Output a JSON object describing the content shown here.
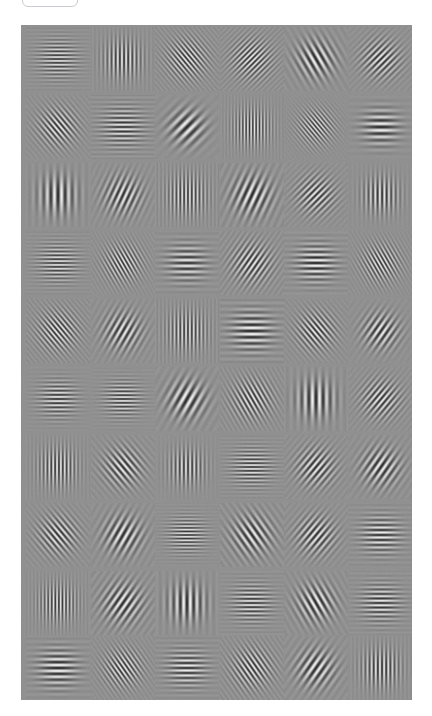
{
  "top_control": {
    "label": "",
    "name": "rounded-button-clipped"
  },
  "stimulus": {
    "background_color": "#8e8e8e",
    "canvas": {
      "x": 21,
      "y": 25,
      "width": 391,
      "height": 675
    },
    "grid": {
      "rows": 10,
      "columns": 6,
      "cell_pitch_x": 65,
      "cell_pitch_y": 68
    },
    "patch_type": "gabor",
    "column_centers": [
      37,
      102,
      166,
      231,
      295,
      360
    ],
    "row_centers": [
      34,
      102,
      170,
      238,
      306,
      374,
      442,
      510,
      578,
      643
    ],
    "patches": [
      {
        "row": 0,
        "col": 0,
        "orientation": 0,
        "frequency": 0.26,
        "phase": 0,
        "sigma": 13,
        "contrast": 0.78
      },
      {
        "row": 0,
        "col": 1,
        "orientation": 90,
        "frequency": 0.24,
        "phase": 90,
        "sigma": 13,
        "contrast": 0.82
      },
      {
        "row": 0,
        "col": 2,
        "orientation": 50,
        "frequency": 0.27,
        "phase": 0,
        "sigma": 14,
        "contrast": 0.8
      },
      {
        "row": 0,
        "col": 3,
        "orientation": 135,
        "frequency": 0.26,
        "phase": 0,
        "sigma": 14,
        "contrast": 0.8
      },
      {
        "row": 0,
        "col": 4,
        "orientation": 60,
        "frequency": 0.16,
        "phase": 0,
        "sigma": 13,
        "contrast": 0.9
      },
      {
        "row": 0,
        "col": 5,
        "orientation": 135,
        "frequency": 0.22,
        "phase": 0,
        "sigma": 13,
        "contrast": 0.82
      },
      {
        "row": 1,
        "col": 0,
        "orientation": 50,
        "frequency": 0.24,
        "phase": 0,
        "sigma": 13,
        "contrast": 0.82
      },
      {
        "row": 1,
        "col": 1,
        "orientation": 0,
        "frequency": 0.22,
        "phase": 0,
        "sigma": 14,
        "contrast": 0.8
      },
      {
        "row": 1,
        "col": 2,
        "orientation": 135,
        "frequency": 0.13,
        "phase": 0,
        "sigma": 12,
        "contrast": 0.88
      },
      {
        "row": 1,
        "col": 3,
        "orientation": 90,
        "frequency": 0.3,
        "phase": 90,
        "sigma": 13,
        "contrast": 0.8
      },
      {
        "row": 1,
        "col": 4,
        "orientation": 50,
        "frequency": 0.3,
        "phase": 0,
        "sigma": 12,
        "contrast": 0.72
      },
      {
        "row": 1,
        "col": 5,
        "orientation": 0,
        "frequency": 0.15,
        "phase": 0,
        "sigma": 12,
        "contrast": 0.88
      },
      {
        "row": 2,
        "col": 0,
        "orientation": 90,
        "frequency": 0.14,
        "phase": 0,
        "sigma": 13,
        "contrast": 0.88
      },
      {
        "row": 2,
        "col": 1,
        "orientation": 115,
        "frequency": 0.18,
        "phase": 0,
        "sigma": 13,
        "contrast": 0.84
      },
      {
        "row": 2,
        "col": 2,
        "orientation": 90,
        "frequency": 0.26,
        "phase": 90,
        "sigma": 14,
        "contrast": 0.8
      },
      {
        "row": 2,
        "col": 3,
        "orientation": 115,
        "frequency": 0.15,
        "phase": 0,
        "sigma": 14,
        "contrast": 0.9
      },
      {
        "row": 2,
        "col": 4,
        "orientation": 135,
        "frequency": 0.22,
        "phase": 0,
        "sigma": 13,
        "contrast": 0.8
      },
      {
        "row": 2,
        "col": 5,
        "orientation": 90,
        "frequency": 0.22,
        "phase": 90,
        "sigma": 12,
        "contrast": 0.82
      },
      {
        "row": 3,
        "col": 0,
        "orientation": 0,
        "frequency": 0.26,
        "phase": 0,
        "sigma": 13,
        "contrast": 0.78
      },
      {
        "row": 3,
        "col": 1,
        "orientation": 60,
        "frequency": 0.28,
        "phase": 0,
        "sigma": 13,
        "contrast": 0.78
      },
      {
        "row": 3,
        "col": 2,
        "orientation": 0,
        "frequency": 0.17,
        "phase": 0,
        "sigma": 13,
        "contrast": 0.8
      },
      {
        "row": 3,
        "col": 3,
        "orientation": 125,
        "frequency": 0.22,
        "phase": 0,
        "sigma": 14,
        "contrast": 0.82
      },
      {
        "row": 3,
        "col": 4,
        "orientation": 0,
        "frequency": 0.18,
        "phase": 0,
        "sigma": 13,
        "contrast": 0.92
      },
      {
        "row": 3,
        "col": 5,
        "orientation": 60,
        "frequency": 0.28,
        "phase": 0,
        "sigma": 13,
        "contrast": 0.78
      },
      {
        "row": 4,
        "col": 0,
        "orientation": 50,
        "frequency": 0.26,
        "phase": 0,
        "sigma": 14,
        "contrast": 0.8
      },
      {
        "row": 4,
        "col": 1,
        "orientation": 120,
        "frequency": 0.18,
        "phase": 0,
        "sigma": 13,
        "contrast": 0.82
      },
      {
        "row": 4,
        "col": 2,
        "orientation": 90,
        "frequency": 0.26,
        "phase": 90,
        "sigma": 14,
        "contrast": 0.78
      },
      {
        "row": 4,
        "col": 3,
        "orientation": 0,
        "frequency": 0.16,
        "phase": 0,
        "sigma": 14,
        "contrast": 0.92
      },
      {
        "row": 4,
        "col": 4,
        "orientation": 50,
        "frequency": 0.24,
        "phase": 0,
        "sigma": 13,
        "contrast": 0.82
      },
      {
        "row": 4,
        "col": 5,
        "orientation": 125,
        "frequency": 0.18,
        "phase": 0,
        "sigma": 12,
        "contrast": 0.86
      },
      {
        "row": 5,
        "col": 0,
        "orientation": 0,
        "frequency": 0.24,
        "phase": 0,
        "sigma": 12,
        "contrast": 0.82
      },
      {
        "row": 5,
        "col": 1,
        "orientation": 0,
        "frequency": 0.26,
        "phase": 0,
        "sigma": 12,
        "contrast": 0.8
      },
      {
        "row": 5,
        "col": 2,
        "orientation": 120,
        "frequency": 0.14,
        "phase": 0,
        "sigma": 13,
        "contrast": 0.9
      },
      {
        "row": 5,
        "col": 3,
        "orientation": 60,
        "frequency": 0.24,
        "phase": 0,
        "sigma": 14,
        "contrast": 0.8
      },
      {
        "row": 5,
        "col": 4,
        "orientation": 90,
        "frequency": 0.14,
        "phase": 0,
        "sigma": 13,
        "contrast": 0.9
      },
      {
        "row": 5,
        "col": 5,
        "orientation": 130,
        "frequency": 0.22,
        "phase": 0,
        "sigma": 13,
        "contrast": 0.82
      },
      {
        "row": 6,
        "col": 0,
        "orientation": 90,
        "frequency": 0.26,
        "phase": 90,
        "sigma": 13,
        "contrast": 0.82
      },
      {
        "row": 6,
        "col": 1,
        "orientation": 50,
        "frequency": 0.2,
        "phase": 0,
        "sigma": 13,
        "contrast": 0.84
      },
      {
        "row": 6,
        "col": 2,
        "orientation": 90,
        "frequency": 0.24,
        "phase": 90,
        "sigma": 12,
        "contrast": 0.78
      },
      {
        "row": 6,
        "col": 3,
        "orientation": 0,
        "frequency": 0.26,
        "phase": 0,
        "sigma": 13,
        "contrast": 0.8
      },
      {
        "row": 6,
        "col": 4,
        "orientation": 130,
        "frequency": 0.2,
        "phase": 0,
        "sigma": 13,
        "contrast": 0.84
      },
      {
        "row": 6,
        "col": 5,
        "orientation": 125,
        "frequency": 0.17,
        "phase": 0,
        "sigma": 13,
        "contrast": 0.88
      },
      {
        "row": 7,
        "col": 0,
        "orientation": 50,
        "frequency": 0.22,
        "phase": 0,
        "sigma": 13,
        "contrast": 0.82
      },
      {
        "row": 7,
        "col": 1,
        "orientation": 120,
        "frequency": 0.16,
        "phase": 0,
        "sigma": 13,
        "contrast": 0.88
      },
      {
        "row": 7,
        "col": 2,
        "orientation": 0,
        "frequency": 0.28,
        "phase": 0,
        "sigma": 12,
        "contrast": 0.8
      },
      {
        "row": 7,
        "col": 3,
        "orientation": 55,
        "frequency": 0.17,
        "phase": 0,
        "sigma": 14,
        "contrast": 0.86
      },
      {
        "row": 7,
        "col": 4,
        "orientation": 130,
        "frequency": 0.2,
        "phase": 0,
        "sigma": 13,
        "contrast": 0.84
      },
      {
        "row": 7,
        "col": 5,
        "orientation": 0,
        "frequency": 0.2,
        "phase": 0,
        "sigma": 13,
        "contrast": 0.84
      },
      {
        "row": 8,
        "col": 0,
        "orientation": 90,
        "frequency": 0.28,
        "phase": 90,
        "sigma": 13,
        "contrast": 0.8
      },
      {
        "row": 8,
        "col": 1,
        "orientation": 125,
        "frequency": 0.17,
        "phase": 0,
        "sigma": 14,
        "contrast": 0.88
      },
      {
        "row": 8,
        "col": 2,
        "orientation": 90,
        "frequency": 0.15,
        "phase": 0,
        "sigma": 13,
        "contrast": 0.9
      },
      {
        "row": 8,
        "col": 3,
        "orientation": 0,
        "frequency": 0.24,
        "phase": 0,
        "sigma": 13,
        "contrast": 0.8
      },
      {
        "row": 8,
        "col": 4,
        "orientation": 60,
        "frequency": 0.17,
        "phase": 0,
        "sigma": 13,
        "contrast": 0.9
      },
      {
        "row": 8,
        "col": 5,
        "orientation": 0,
        "frequency": 0.22,
        "phase": 0,
        "sigma": 13,
        "contrast": 0.82
      },
      {
        "row": 9,
        "col": 0,
        "orientation": 0,
        "frequency": 0.17,
        "phase": 0,
        "sigma": 13,
        "contrast": 0.92
      },
      {
        "row": 9,
        "col": 1,
        "orientation": 55,
        "frequency": 0.26,
        "phase": 0,
        "sigma": 13,
        "contrast": 0.8
      },
      {
        "row": 9,
        "col": 2,
        "orientation": 0,
        "frequency": 0.2,
        "phase": 0,
        "sigma": 13,
        "contrast": 0.84
      },
      {
        "row": 9,
        "col": 3,
        "orientation": 55,
        "frequency": 0.24,
        "phase": 0,
        "sigma": 14,
        "contrast": 0.8
      },
      {
        "row": 9,
        "col": 4,
        "orientation": 125,
        "frequency": 0.16,
        "phase": 0,
        "sigma": 13,
        "contrast": 0.88
      },
      {
        "row": 9,
        "col": 5,
        "orientation": 90,
        "frequency": 0.24,
        "phase": 90,
        "sigma": 13,
        "contrast": 0.84
      }
    ]
  }
}
